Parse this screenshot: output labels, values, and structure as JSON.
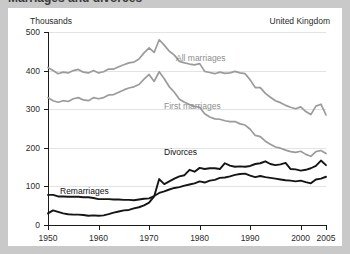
{
  "figure": {
    "title": "Marriages and divorces",
    "units_label": "Thousands",
    "region_label": "United Kingdom"
  },
  "annotations": {
    "all_marriages": "All marriages",
    "first_marriages": "First marriages",
    "divorces": "Divorces",
    "remarriages": "Remarriages"
  },
  "colors": {
    "gray_series": "#9b9b9b",
    "black_series": "#151515",
    "gridline": "#e3e3e3",
    "axis": "#1a1a1a",
    "panel_background": "#ffffff",
    "page_background": "#c9c9c9"
  },
  "chart_data": {
    "type": "line",
    "title": "Marriages and divorces",
    "subtitle": "United Kingdom",
    "xlabel": "",
    "ylabel": "Thousands",
    "xlim": [
      1950,
      2005
    ],
    "ylim": [
      0,
      500
    ],
    "grid": true,
    "legend": "inline-labels",
    "ytick_labels": [
      "0",
      "100",
      "200",
      "300",
      "400",
      "500"
    ],
    "ytick_values": [
      0,
      100,
      200,
      300,
      400,
      500
    ],
    "xtick_labels": [
      "1950",
      "1960",
      "1970",
      "1980",
      "1990",
      "2000",
      "2005"
    ],
    "xtick_values": [
      1950,
      1960,
      1970,
      1980,
      1990,
      2000,
      2005
    ],
    "x": [
      1950,
      1951,
      1952,
      1953,
      1954,
      1955,
      1956,
      1957,
      1958,
      1959,
      1960,
      1961,
      1962,
      1963,
      1964,
      1965,
      1966,
      1967,
      1968,
      1969,
      1970,
      1971,
      1972,
      1973,
      1974,
      1975,
      1976,
      1977,
      1978,
      1979,
      1980,
      1981,
      1982,
      1983,
      1984,
      1985,
      1986,
      1987,
      1988,
      1989,
      1990,
      1991,
      1992,
      1993,
      1994,
      1995,
      1996,
      1997,
      1998,
      1999,
      2000,
      2001,
      2002,
      2003,
      2004,
      2005
    ],
    "series": [
      {
        "name": "All marriages",
        "color": "#9b9b9b",
        "values": [
          408,
          400,
          392,
          396,
          394,
          400,
          403,
          396,
          394,
          400,
          394,
          397,
          404,
          404,
          410,
          415,
          420,
          422,
          430,
          446,
          459,
          447,
          480,
          466,
          450,
          440,
          424,
          420,
          417,
          415,
          418,
          398,
          395,
          392,
          396,
          393,
          394,
          398,
          394,
          392,
          376,
          356,
          356,
          341,
          331,
          322,
          317,
          310,
          305,
          301,
          306,
          294,
          286,
          308,
          313,
          285
        ]
      },
      {
        "name": "First marriages",
        "color": "#9b9b9b",
        "values": [
          330,
          322,
          318,
          322,
          320,
          327,
          330,
          324,
          322,
          330,
          327,
          330,
          337,
          338,
          344,
          350,
          355,
          358,
          364,
          378,
          390,
          372,
          397,
          379,
          358,
          344,
          326,
          318,
          312,
          307,
          305,
          288,
          280,
          275,
          274,
          270,
          268,
          268,
          262,
          259,
          248,
          232,
          229,
          217,
          209,
          202,
          199,
          194,
          190,
          188,
          191,
          183,
          178,
          190,
          193,
          185
        ]
      },
      {
        "name": "Divorces",
        "color": "#151515",
        "values": [
          30,
          38,
          34,
          30,
          28,
          27,
          27,
          26,
          24,
          25,
          24,
          25,
          28,
          32,
          35,
          38,
          39,
          43,
          46,
          51,
          58,
          74,
          119,
          106,
          113,
          120,
          126,
          129,
          143,
          138,
          148,
          145,
          147,
          147,
          145,
          160,
          154,
          151,
          152,
          151,
          153,
          158,
          160,
          165,
          158,
          155,
          157,
          161,
          145,
          144,
          141,
          143,
          147,
          153,
          167,
          155
        ]
      },
      {
        "name": "Remarriages",
        "color": "#151515",
        "values": [
          78,
          78,
          74,
          74,
          73,
          73,
          73,
          72,
          72,
          70,
          67,
          67,
          67,
          66,
          66,
          65,
          65,
          64,
          66,
          68,
          69,
          75,
          83,
          87,
          92,
          96,
          98,
          102,
          105,
          108,
          113,
          110,
          115,
          117,
          122,
          123,
          126,
          130,
          132,
          133,
          128,
          124,
          127,
          124,
          122,
          120,
          118,
          116,
          115,
          113,
          115,
          111,
          108,
          118,
          120,
          125
        ]
      }
    ]
  }
}
